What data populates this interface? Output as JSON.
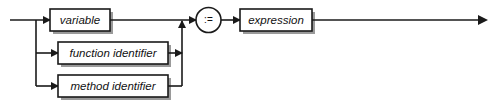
{
  "diagram": {
    "kind": "railroad-syntax-diagram",
    "colors": {
      "line": "#1a1a1a",
      "box_fill": "#ffffff",
      "box_stroke": "#1a1a1a",
      "shadow": "#9a9a9a",
      "text": "#111111",
      "background": "#ffffff"
    },
    "alternatives": [
      {
        "id": "variable",
        "label": "variable"
      },
      {
        "id": "function-identifier",
        "label": "function identifier"
      },
      {
        "id": "method-identifier",
        "label": "method identifier"
      }
    ],
    "operator": {
      "id": "assign-operator",
      "label": ":="
    },
    "result": {
      "id": "expression",
      "label": "expression"
    }
  }
}
